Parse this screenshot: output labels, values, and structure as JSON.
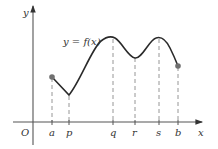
{
  "diagram": {
    "function_label": "y = f(x)",
    "axes": {
      "x_label": "x",
      "y_label": "y",
      "origin_label": "O"
    },
    "points": [
      {
        "name": "a",
        "label": "a",
        "kind": "endpoint",
        "marker": "filled-dot"
      },
      {
        "name": "p",
        "label": "p",
        "kind": "local-minimum-corner"
      },
      {
        "name": "q",
        "label": "q",
        "kind": "local-maximum"
      },
      {
        "name": "r",
        "label": "r",
        "kind": "local-minimum"
      },
      {
        "name": "s",
        "label": "s",
        "kind": "local-maximum"
      },
      {
        "name": "b",
        "label": "b",
        "kind": "endpoint",
        "marker": "filled-dot"
      }
    ],
    "colors": {
      "curve": "#2a2a2a",
      "axis": "#555555",
      "dashed": "#8a8a8a",
      "endpoint_dot": "#707070"
    }
  }
}
